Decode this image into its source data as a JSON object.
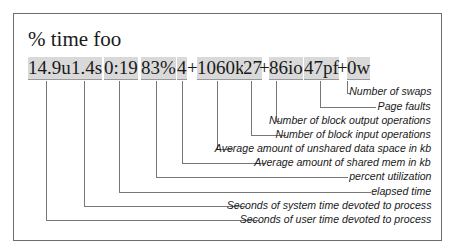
{
  "title": "% time foo",
  "values": [
    {
      "text": "14.9u",
      "highlight": true
    },
    {
      "text": "1.4s",
      "highlight": true
    },
    {
      "text": "0:19",
      "highlight": true
    },
    {
      "text": "83%",
      "highlight": true
    },
    {
      "text": "4",
      "highlight": true
    },
    {
      "text": "+",
      "highlight": false
    },
    {
      "text": "1060k",
      "highlight": true
    },
    {
      "text": "27",
      "highlight": true
    },
    {
      "text": "+",
      "highlight": false
    },
    {
      "text": "86io",
      "highlight": true
    },
    {
      "text": "47pf",
      "highlight": true
    },
    {
      "text": "+",
      "highlight": false
    },
    {
      "text": "0w",
      "highlight": true
    }
  ],
  "labels": [
    "Number of swaps",
    "Page faults",
    "Number of block output operations",
    "Number of block input operations",
    "Average amount of unshared data space in kb",
    "Average amount of shared mem in kb",
    "percent utilization",
    "elapsed time",
    "Seconds of system time devoted to process",
    "Seconds of user time devoted to process"
  ],
  "colors": {
    "highlight": "#d9d9d9",
    "line": "#777777",
    "frame": "#6e6e6e"
  }
}
